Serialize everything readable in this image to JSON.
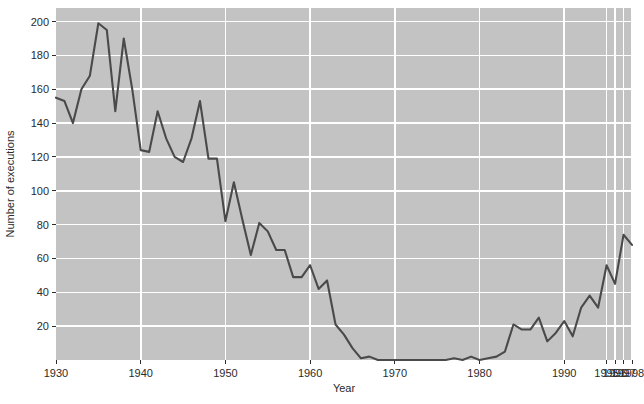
{
  "chart_data": {
    "type": "line",
    "title": "",
    "xlabel": "Year",
    "ylabel": "Number of executions",
    "xlim": [
      1930,
      1998
    ],
    "ylim": [
      0,
      208
    ],
    "grid": true,
    "legend": false,
    "legend_position": "none",
    "xtick_labels": [
      "1930",
      "1940",
      "1950",
      "1960",
      "1970",
      "1980",
      "1990",
      "1995",
      "1996",
      "1997",
      "1998"
    ],
    "xtick_values": [
      1930,
      1940,
      1950,
      1960,
      1970,
      1980,
      1990,
      1995,
      1996,
      1997,
      1998
    ],
    "ytick_labels": [
      "20",
      "40",
      "60",
      "80",
      "100",
      "120",
      "140",
      "160",
      "180",
      "200"
    ],
    "ytick_values": [
      20,
      40,
      60,
      80,
      100,
      120,
      140,
      160,
      180,
      200
    ],
    "series": [
      {
        "name": "Number of executions",
        "color": "#4a4a4a",
        "x": [
          1930,
          1931,
          1932,
          1933,
          1934,
          1935,
          1936,
          1937,
          1938,
          1939,
          1940,
          1941,
          1942,
          1943,
          1944,
          1945,
          1946,
          1947,
          1948,
          1949,
          1950,
          1951,
          1952,
          1953,
          1954,
          1955,
          1956,
          1957,
          1958,
          1959,
          1960,
          1961,
          1962,
          1963,
          1964,
          1965,
          1966,
          1967,
          1968,
          1969,
          1970,
          1971,
          1972,
          1973,
          1974,
          1975,
          1976,
          1977,
          1978,
          1979,
          1980,
          1981,
          1982,
          1983,
          1984,
          1985,
          1986,
          1987,
          1988,
          1989,
          1990,
          1991,
          1992,
          1993,
          1994,
          1995,
          1996,
          1997,
          1998
        ],
        "values": [
          155,
          153,
          140,
          160,
          168,
          199,
          195,
          147,
          190,
          160,
          124,
          123,
          147,
          131,
          120,
          117,
          131,
          153,
          119,
          119,
          82,
          105,
          83,
          62,
          81,
          76,
          65,
          65,
          49,
          49,
          56,
          42,
          47,
          21,
          15,
          7,
          1,
          2,
          0,
          0,
          0,
          0,
          0,
          0,
          0,
          0,
          0,
          1,
          0,
          2,
          0,
          1,
          2,
          5,
          21,
          18,
          18,
          25,
          11,
          16,
          23,
          14,
          31,
          38,
          31,
          56,
          45,
          74,
          68
        ]
      }
    ]
  },
  "plot": {
    "background_color": "#c3c3c3",
    "gridline_color": "#ffffff",
    "line_color": "#4a4a4a",
    "axis_text_color": "#2b2b2b"
  }
}
